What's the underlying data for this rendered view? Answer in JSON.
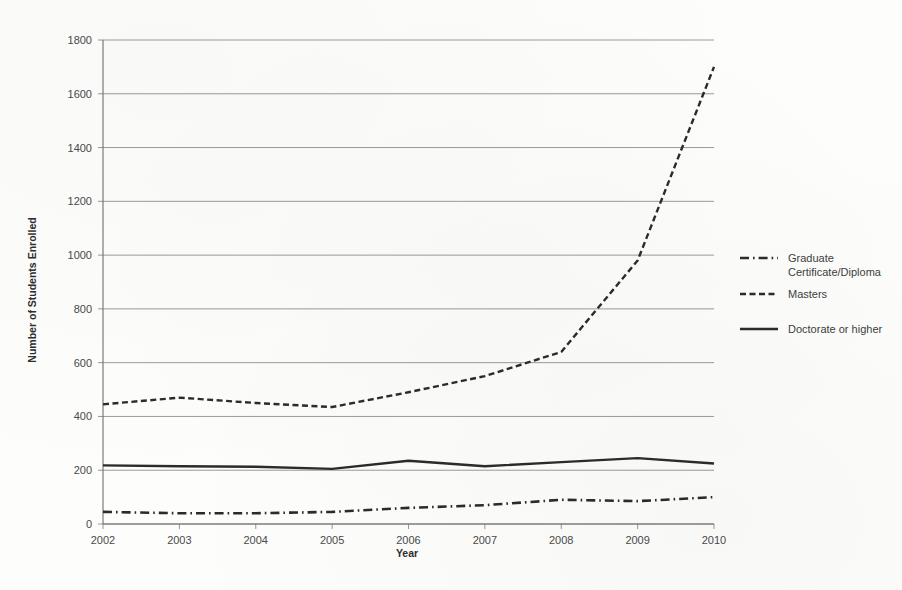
{
  "figure": {
    "background_color": "#fdfdfc",
    "ink_color": "#2b2b2b",
    "grid_color": "#8e8e8e"
  },
  "chart_data": {
    "type": "line",
    "title": "",
    "subtitle": "",
    "xlabel": "Year",
    "ylabel": "Number of Students Enrolled",
    "grid": "horizontal",
    "legend_position": "right",
    "categories": [
      2002,
      2003,
      2004,
      2005,
      2006,
      2007,
      2008,
      2009,
      2010
    ],
    "x_tick_labels": [
      "2002",
      "2003",
      "2004",
      "2005",
      "2006",
      "2007",
      "2008",
      "2009",
      "2010"
    ],
    "y_tick_labels": [
      "0",
      "200",
      "400",
      "600",
      "800",
      "1000",
      "1200",
      "1400",
      "1600",
      "1800"
    ],
    "y_ticks": [
      0,
      200,
      400,
      600,
      800,
      1000,
      1200,
      1400,
      1600,
      1800
    ],
    "ylim": [
      0,
      1800
    ],
    "xlim": [
      2002,
      2010
    ],
    "series": [
      {
        "name": "Graduate Certificate/Diploma",
        "dash": "dashdot",
        "width": 2.6,
        "values": [
          45,
          40,
          40,
          45,
          60,
          70,
          90,
          85,
          100
        ]
      },
      {
        "name": "Masters",
        "dash": "dashed",
        "width": 2.4,
        "values": [
          445,
          470,
          450,
          435,
          490,
          550,
          640,
          980,
          1700
        ]
      },
      {
        "name": "Doctorate or higher",
        "dash": "solid",
        "width": 2.4,
        "values": [
          218,
          215,
          213,
          205,
          235,
          215,
          230,
          245,
          225
        ]
      }
    ]
  },
  "legend": {
    "entries": [
      {
        "label_line1": "Graduate",
        "label_line2": "Certificate/Diploma",
        "style": "dashdot"
      },
      {
        "label_line1": "Masters",
        "label_line2": "",
        "style": "dashed"
      },
      {
        "label_line1": "Doctorate or higher",
        "label_line2": "",
        "style": "solid"
      }
    ]
  }
}
